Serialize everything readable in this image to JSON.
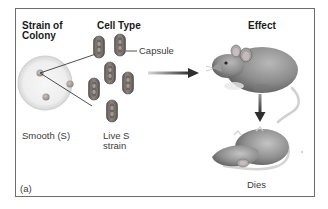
{
  "figure": {
    "panel_label": "(a)",
    "columns": {
      "strain": "Strain of Colony",
      "strain_line1": "Strain of",
      "strain_line2": "Colony",
      "cell_type": "Cell Type",
      "effect": "Effect"
    },
    "labels": {
      "capsule": "Capsule",
      "strain_name": "Smooth (S)",
      "cell_line1": "Live S",
      "cell_line2": "strain",
      "outcome": "Dies"
    },
    "icons": {
      "petri_dish": "petri-dish-icon",
      "bacteria": "encapsulated-bacterium-icon",
      "arrow_right": "arrow-right-icon",
      "arrow_down": "arrow-down-icon",
      "live_mouse": "live-mouse-icon",
      "dead_mouse": "dead-mouse-icon"
    },
    "colors": {
      "frame_border": "#6d6d6d",
      "capsule_fill": "#7a7470",
      "capsule_inner": "#5e5652",
      "cell_stripe": "#8e8782",
      "dish_fill": "#efefef",
      "arrow": "#3a3a3a",
      "mouse_body": "#9a9a9a"
    }
  }
}
